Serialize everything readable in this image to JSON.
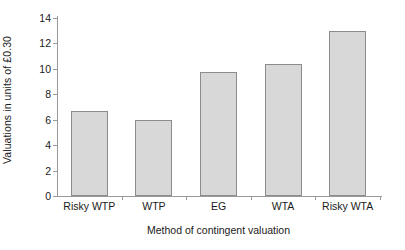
{
  "chart_data": {
    "type": "bar",
    "title": "",
    "subtitle": "",
    "categories": [
      "Risky WTP",
      "WTP",
      "EG",
      "WTA",
      "Risky WTA"
    ],
    "values": [
      6.65,
      5.95,
      9.75,
      10.4,
      12.95
    ],
    "series": [
      {
        "name": "Valuations",
        "values": [
          6.65,
          5.95,
          9.75,
          10.4,
          12.95
        ]
      }
    ],
    "xlabel": "Method of contingent valuation",
    "ylabel": "Valuations in units of £0.30",
    "ylim": [
      0,
      14
    ],
    "yticks": [
      0,
      2,
      4,
      6,
      8,
      10,
      12,
      14
    ],
    "ytick_labels": [
      "0",
      "2",
      "4",
      "6",
      "8",
      "10",
      "12",
      "14"
    ],
    "grid": false,
    "legend": false,
    "legend_position": "none",
    "bar_fill_color": "#d8d8d8",
    "bar_border_color": "#8c8c8c",
    "axis_color": "#9a9a9a",
    "text_color": "#1a1a1a",
    "background_color": "#ffffff"
  }
}
